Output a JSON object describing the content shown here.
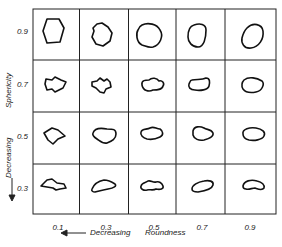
{
  "diagram": {
    "type": "shape-classification-grid",
    "rows_label": "Sphericity",
    "rows_direction_label": "Decreasing",
    "cols_label": "Roundness",
    "cols_direction_label": "Decreasing",
    "row_values": [
      "0.9",
      "0.7",
      "0.5",
      "0.3"
    ],
    "col_values": [
      "0.1",
      "0.3",
      "0.5",
      "0.7",
      "0.9"
    ],
    "arrow_symbol_left": "←———",
    "arrow_symbol_down": "←———"
  }
}
